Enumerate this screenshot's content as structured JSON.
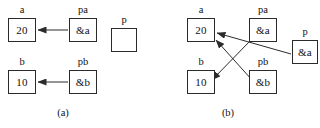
{
  "figure": {
    "width": 320,
    "height": 128,
    "background_color": "#ffffff",
    "stroke_color": "#2b2b2b",
    "text_color": "#111111"
  },
  "panels": [
    {
      "id": "panel-a",
      "caption": "(a)",
      "caption_x": 63,
      "caption_y": 108,
      "nodes": [
        {
          "id": "a-a",
          "name": "variable-a",
          "label": "a",
          "value": "20",
          "x": 8,
          "y": 18,
          "w": 28,
          "h": 24,
          "label_x": 8,
          "label_y": 5,
          "label_w": 28
        },
        {
          "id": "a-pa",
          "name": "pointer-pa",
          "label": "pa",
          "value": "&a",
          "x": 69,
          "y": 18,
          "w": 28,
          "h": 24,
          "label_x": 69,
          "label_y": 5,
          "label_w": 28
        },
        {
          "id": "a-p",
          "name": "pointer-p",
          "label": "p",
          "value": "",
          "x": 111,
          "y": 28,
          "w": 26,
          "h": 24,
          "label_x": 111,
          "label_y": 15,
          "label_w": 26
        },
        {
          "id": "a-b",
          "name": "variable-b",
          "label": "b",
          "value": "10",
          "x": 8,
          "y": 70,
          "w": 28,
          "h": 24,
          "label_x": 8,
          "label_y": 57,
          "label_w": 28
        },
        {
          "id": "a-pb",
          "name": "pointer-pb",
          "label": "pb",
          "value": "&b",
          "x": 69,
          "y": 70,
          "w": 28,
          "h": 24,
          "label_x": 69,
          "label_y": 57,
          "label_w": 28
        }
      ],
      "edges": [
        {
          "id": "a-edge-pa-to-a",
          "name": "arrow-pa-to-a",
          "from": "pa",
          "to": "a",
          "x1": 68,
          "y1": 30,
          "x2": 38,
          "y2": 30
        },
        {
          "id": "a-edge-pb-to-b",
          "name": "arrow-pb-to-b",
          "from": "pb",
          "to": "b",
          "x1": 68,
          "y1": 82,
          "x2": 38,
          "y2": 82
        }
      ]
    },
    {
      "id": "panel-b",
      "caption": "(b)",
      "caption_x": 228,
      "caption_y": 108,
      "nodes": [
        {
          "id": "b-a",
          "name": "variable-a",
          "label": "a",
          "value": "20",
          "x": 187,
          "y": 18,
          "w": 28,
          "h": 24,
          "label_x": 187,
          "label_y": 5,
          "label_w": 28
        },
        {
          "id": "b-pa",
          "name": "pointer-pa",
          "label": "pa",
          "value": "&a",
          "x": 249,
          "y": 18,
          "w": 28,
          "h": 24,
          "label_x": 249,
          "label_y": 5,
          "label_w": 28
        },
        {
          "id": "b-p",
          "name": "pointer-p",
          "label": "p",
          "value": "&a",
          "x": 292,
          "y": 40,
          "w": 26,
          "h": 24,
          "label_x": 292,
          "label_y": 27,
          "label_w": 26
        },
        {
          "id": "b-b",
          "name": "variable-b",
          "label": "b",
          "value": "10",
          "x": 187,
          "y": 70,
          "w": 28,
          "h": 24,
          "label_x": 187,
          "label_y": 57,
          "label_w": 28
        },
        {
          "id": "b-pb",
          "name": "pointer-pb",
          "label": "pb",
          "value": "&b",
          "x": 249,
          "y": 70,
          "w": 28,
          "h": 24,
          "label_x": 249,
          "label_y": 57,
          "label_w": 28
        }
      ],
      "edges": [
        {
          "id": "b-edge-p-to-a",
          "name": "arrow-p-to-a",
          "from": "p",
          "to": "a",
          "x1": 291,
          "y1": 54,
          "x2": 217,
          "y2": 33
        },
        {
          "id": "b-edge-pb-to-a",
          "name": "arrow-pb-to-a",
          "from": "pb",
          "to": "a",
          "x1": 252,
          "y1": 80,
          "x2": 216,
          "y2": 40
        },
        {
          "id": "b-edge-pa-to-b",
          "name": "arrow-pa-to-b",
          "from": "pa",
          "to": "b",
          "x1": 250,
          "y1": 41,
          "x2": 212,
          "y2": 80
        }
      ]
    }
  ]
}
